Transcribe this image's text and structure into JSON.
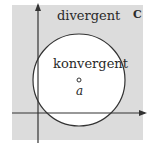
{
  "diagram": {
    "region_outside_label": "divergent",
    "region_inside_label": "konvergent",
    "center_label": "a",
    "plane_label": "C",
    "colors": {
      "plane_fill": "#dcdcdc",
      "disk_fill": "#ffffff",
      "stroke": "#333333"
    }
  }
}
